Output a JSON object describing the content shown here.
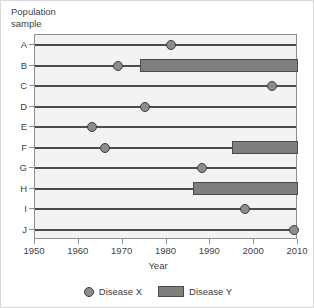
{
  "chart_data": {
    "type": "table",
    "title": "",
    "ylabel": "Population\nsample",
    "xlabel": "Year",
    "xlim": [
      1950,
      2010
    ],
    "xticks": [
      1950,
      1960,
      1970,
      1980,
      1990,
      2000,
      2010
    ],
    "xtick_labels": [
      "1950",
      "1960",
      "1970",
      "1980",
      "1990",
      "2000",
      "2010"
    ],
    "categories": [
      "A",
      "B",
      "C",
      "D",
      "E",
      "F",
      "G",
      "H",
      "I",
      "J"
    ],
    "grid": false,
    "legend_position": "bottom",
    "legend": [
      {
        "label": "Disease X",
        "marker": "circle",
        "color": "#8c8c8c"
      },
      {
        "label": "Disease Y",
        "marker": "bar",
        "color": "#7f7f7f"
      }
    ],
    "rows": [
      {
        "category": "A",
        "disease_x_year": 1981,
        "disease_y_start": null,
        "disease_y_end": null
      },
      {
        "category": "B",
        "disease_x_year": 1969,
        "disease_y_start": 1974,
        "disease_y_end": 2010
      },
      {
        "category": "C",
        "disease_x_year": 2004,
        "disease_y_start": null,
        "disease_y_end": null
      },
      {
        "category": "D",
        "disease_x_year": 1975,
        "disease_y_start": null,
        "disease_y_end": null
      },
      {
        "category": "E",
        "disease_x_year": 1963,
        "disease_y_start": null,
        "disease_y_end": null
      },
      {
        "category": "F",
        "disease_x_year": 1966,
        "disease_y_start": 1995,
        "disease_y_end": 2010
      },
      {
        "category": "G",
        "disease_x_year": 1988,
        "disease_y_start": null,
        "disease_y_end": null
      },
      {
        "category": "H",
        "disease_x_year": null,
        "disease_y_start": 1986,
        "disease_y_end": 2010
      },
      {
        "category": "I",
        "disease_x_year": 1998,
        "disease_y_start": null,
        "disease_y_end": null
      },
      {
        "category": "J",
        "disease_x_year": 2009,
        "disease_y_start": null,
        "disease_y_end": null
      }
    ]
  },
  "axes": {
    "y_title": "Population\nsample",
    "x_title": "Year"
  },
  "legend": {
    "disease_x_label": "Disease X",
    "disease_y_label": "Disease Y"
  },
  "colors": {
    "bar_fill": "#7f7f7f",
    "bar_border": "#4a4a4a",
    "marker_fill": "#8c8c8c",
    "marker_border": "#3d3d3d",
    "plot_background": "#f3f3f3",
    "axis_line": "#8f8f8f",
    "row_line": "#4c4c4c"
  }
}
